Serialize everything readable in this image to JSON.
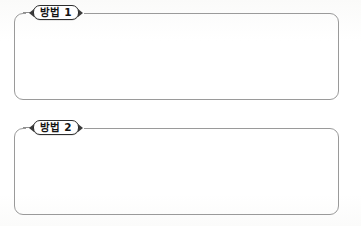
{
  "page": {
    "background_color": "#ffffff",
    "width": 361,
    "height": 226
  },
  "style": {
    "box_border_color": "#9a9a9a",
    "badge_border_color": "#2e2e2e",
    "badge_fill_color": "#ffffff",
    "badge_text_color": "#141414",
    "notch_color": "#3a3a3a"
  },
  "blocks": [
    {
      "badge_label": "방법 1",
      "badge_icon_left": "triangle-left-notch-icon",
      "badge_icon_right": "triangle-right-notch-icon",
      "content": "",
      "top": 13,
      "height": 87
    },
    {
      "badge_label": "방법 2",
      "badge_icon_left": "triangle-left-notch-icon",
      "badge_icon_right": "triangle-right-notch-icon",
      "content": "",
      "top": 128,
      "height": 87
    }
  ]
}
